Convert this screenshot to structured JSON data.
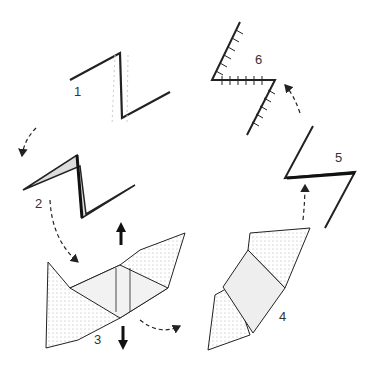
{
  "diagram": {
    "type": "process-cycle",
    "steps": [
      {
        "id": 1,
        "label": "1",
        "content": "Z-shaped incision line"
      },
      {
        "id": 2,
        "label": "2",
        "content": "Incised Z with opened edges"
      },
      {
        "id": 3,
        "label": "3",
        "content": "Flaps raised with tension arrows (up/down)"
      },
      {
        "id": 4,
        "label": "4",
        "content": "Flaps transposed"
      },
      {
        "id": 5,
        "label": "5",
        "content": "Rotated Z configuration"
      },
      {
        "id": 6,
        "label": "6",
        "content": "Sutured closure"
      }
    ],
    "arrows": [
      {
        "from": 1,
        "to": 2,
        "style": "dashed"
      },
      {
        "from": 2,
        "to": 3,
        "style": "dashed"
      },
      {
        "from": 3,
        "to": 4,
        "style": "dashed"
      },
      {
        "from": 4,
        "to": 5,
        "style": "dashed"
      },
      {
        "from": 5,
        "to": 6,
        "style": "dashed"
      }
    ],
    "colors": {
      "ink": "#222222",
      "paper": "#ffffff",
      "shade": "#bbbbbb"
    }
  }
}
